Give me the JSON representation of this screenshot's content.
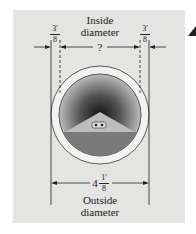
{
  "figure": {
    "inside_label_line1": "Inside",
    "inside_label_line2": "diameter",
    "inside_value": "?",
    "left_wall": {
      "num": "3",
      "den": "8",
      "unit": "′"
    },
    "right_wall": {
      "num": "3",
      "den": "8",
      "unit": "′"
    },
    "outside_whole": "4",
    "outside_frac": {
      "num": "1",
      "den": "8",
      "unit": "′"
    },
    "outside_label_line1": "Outside",
    "outside_label_line2": "diameter"
  },
  "colors": {
    "background": "#e4e4e2",
    "pipe_ring": "#f2f2f0",
    "line": "#222222",
    "water": "#7a7a7a"
  }
}
